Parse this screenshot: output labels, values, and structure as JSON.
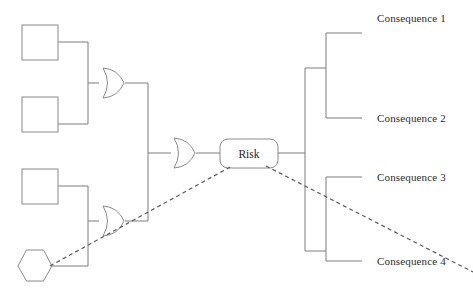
{
  "diagram": {
    "type": "bowtie-risk-diagram",
    "canvas": {
      "width": 473,
      "height": 291
    },
    "center_node": {
      "label": "Risk",
      "shape": "rounded-rectangle",
      "x": 220,
      "y": 139,
      "width": 58,
      "height": 29
    },
    "threat_nodes": [
      {
        "id": "threat-1",
        "label": "",
        "shape": "square",
        "x": 22,
        "y": 25,
        "width": 36,
        "height": 35
      },
      {
        "id": "threat-2",
        "label": "",
        "shape": "square",
        "x": 22,
        "y": 97,
        "width": 36,
        "height": 35
      },
      {
        "id": "threat-3",
        "label": "",
        "shape": "square",
        "x": 22,
        "y": 169,
        "width": 36,
        "height": 35
      },
      {
        "id": "threat-4",
        "label": "",
        "shape": "hexagon",
        "x": 18,
        "y": 248,
        "width": 34,
        "height": 32
      }
    ],
    "gates": [
      {
        "id": "gate-top",
        "type": "or-gate",
        "cx": 112,
        "cy": 83
      },
      {
        "id": "gate-bottom",
        "type": "or-gate",
        "cx": 112,
        "cy": 221
      },
      {
        "id": "gate-center",
        "type": "or-gate",
        "cx": 183,
        "cy": 153
      }
    ],
    "consequences": [
      {
        "id": "consequence-1",
        "label": "Consequence 1",
        "stub_y": 33,
        "text_x": 377,
        "text_y": 22
      },
      {
        "id": "consequence-2",
        "label": "Consequence 2",
        "stub_y": 118,
        "text_x": 377,
        "text_y": 122
      },
      {
        "id": "consequence-3",
        "label": "Consequence 3",
        "stub_y": 177,
        "text_x": 377,
        "text_y": 181
      },
      {
        "id": "consequence-4",
        "label": "Consequence 4",
        "stub_y": 261,
        "text_x": 377,
        "text_y": 265
      }
    ],
    "escalation_lines": [
      {
        "id": "escalation-left",
        "from": "threat-4",
        "to": "center_node",
        "style": "dashed"
      },
      {
        "id": "escalation-right",
        "from": "center_node",
        "to": "consequence-4",
        "style": "dashed"
      }
    ],
    "colors": {
      "edge": "#7d7d7d",
      "node_stroke": "#8a8a8a",
      "dashed": "#5a5a5a",
      "text": "#2b2b2b",
      "background": "#ffffff"
    }
  }
}
